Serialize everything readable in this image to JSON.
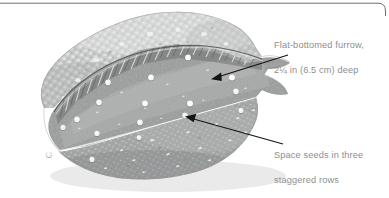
{
  "figure": {
    "background_color": "#ffffff",
    "rule_color": "#6f6f6f",
    "text_color": "#8e8e8e",
    "arrow_color": "#1a1a1a"
  },
  "callouts": [
    {
      "id": "callout-furrow",
      "line1": "Flat-bottomed furrow,",
      "line2": "2¼ in (6.5 cm) deep",
      "full_text": "Flat-bottomed furrow, 2¼ in (6.5 cm) deep",
      "depth_value": "2¼",
      "depth_unit_imperial": "in",
      "depth_metric": "6.5 cm",
      "points_to": "furrow-bottom"
    },
    {
      "id": "callout-seeds",
      "line1": "Space seeds in three",
      "line2": "staggered rows",
      "full_text": "Space seeds in three staggered rows",
      "row_count": "three",
      "points_to": "seed-row-middle"
    }
  ],
  "arrows": [
    {
      "id": "arrow-furrow",
      "from_x": 288,
      "from_y": 55,
      "to_x": 211,
      "to_y": 79
    },
    {
      "id": "arrow-seeds",
      "from_x": 283,
      "from_y": 144,
      "to_x": 185,
      "to_y": 116
    }
  ],
  "illustration": {
    "kind": "watercolor-soil-bed",
    "soil_light_color": "#bfc1c0",
    "soil_mid_color": "#9a9c9b",
    "soil_dark_color": "#7b7d7c",
    "seed_color": "#f6f6f4",
    "seed_count": 17,
    "seed_rows": 3,
    "seeds": [
      {
        "x": 188,
        "y": 58
      },
      {
        "x": 232,
        "y": 78
      },
      {
        "x": 151,
        "y": 78
      },
      {
        "x": 108,
        "y": 83
      },
      {
        "x": 190,
        "y": 104
      },
      {
        "x": 145,
        "y": 104
      },
      {
        "x": 99,
        "y": 103
      },
      {
        "x": 77,
        "y": 120
      },
      {
        "x": 140,
        "y": 123
      },
      {
        "x": 241,
        "y": 111
      },
      {
        "x": 63,
        "y": 128
      },
      {
        "x": 97,
        "y": 134
      },
      {
        "x": 185,
        "y": 116
      },
      {
        "x": 49,
        "y": 155
      },
      {
        "x": 92,
        "y": 160
      },
      {
        "x": 139,
        "y": 138
      },
      {
        "x": 236,
        "y": 92
      }
    ]
  }
}
